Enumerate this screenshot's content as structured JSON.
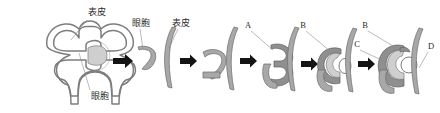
{
  "figure": {
    "background_color": "#ffffff",
    "outline_color": "#7d7d7d",
    "band_color": "#a8a8a8",
    "arrow_color": "#141414",
    "leader_color": "#8c8c8c",
    "width": 440,
    "height": 113
  },
  "labels": {
    "epidermis": "表皮",
    "optic_vesicle": "眼胞",
    "a": "A",
    "b": "B",
    "c": "C",
    "d": "D"
  },
  "panels": [
    {
      "index": 1,
      "name": "neural-tube-with-optic-vesicles",
      "labels": [
        "表皮",
        "眼胞"
      ]
    },
    {
      "index": 2,
      "name": "optic-vesicle-approaching-epidermis",
      "labels": [
        "眼胞",
        "表皮"
      ]
    },
    {
      "index": 3,
      "name": "optic-vesicle-contacting-epidermis",
      "labels": []
    },
    {
      "index": 4,
      "name": "optic-cup-invagination",
      "labels": [
        "A"
      ]
    },
    {
      "index": 5,
      "name": "lens-vesicle-forming",
      "labels": [
        "B"
      ]
    },
    {
      "index": 6,
      "name": "mature-optic-cup-with-lens",
      "labels": [
        "B",
        "C",
        "D"
      ]
    }
  ],
  "arrows": [
    {
      "index": 1,
      "name": "arrow-panel1-to-panel2"
    },
    {
      "index": 2,
      "name": "arrow-panel2-to-panel3"
    },
    {
      "index": 3,
      "name": "arrow-panel3-to-panel4"
    },
    {
      "index": 4,
      "name": "arrow-panel4-to-panel5"
    },
    {
      "index": 5,
      "name": "arrow-panel5-to-panel6"
    }
  ]
}
